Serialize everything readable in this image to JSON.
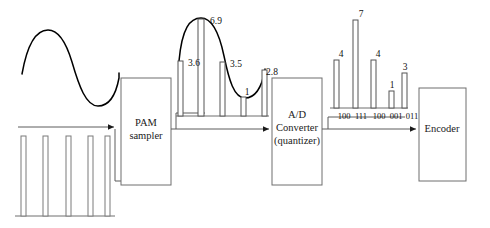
{
  "diagram": {
    "blocks": [
      {
        "id": "pam",
        "name": "pam-sampler-block",
        "line1": "PAM",
        "line2": "sampler",
        "line3": ""
      },
      {
        "id": "adc",
        "name": "ad-converter-block",
        "line1": "A/D",
        "line2": "Converter",
        "line3": "(quantizer)"
      },
      {
        "id": "encoder",
        "name": "encoder-block",
        "line1": "Encoder",
        "line2": "",
        "line3": ""
      }
    ],
    "analog_input": {
      "label": "analog sine wave input"
    },
    "clock": {
      "label": "sampling clock pulse train",
      "pulse_count": 5
    },
    "pam_output": {
      "label": "PAM sampled values",
      "values": [
        "3.6",
        "6.9",
        "3.5",
        "1",
        "2.8"
      ],
      "heights": [
        3.6,
        6.9,
        3.5,
        1.0,
        2.8
      ]
    },
    "quantized_output": {
      "label": "quantized levels",
      "values": [
        "4",
        "7",
        "4",
        "1",
        "3"
      ],
      "heights": [
        4,
        7,
        4,
        1,
        3
      ],
      "codes": [
        "100",
        "111",
        "100",
        "001",
        "011"
      ]
    },
    "colors": {
      "stroke": "#5d5d5d",
      "curve": "#000000",
      "text": "#111111",
      "background": "#ffffff"
    }
  }
}
